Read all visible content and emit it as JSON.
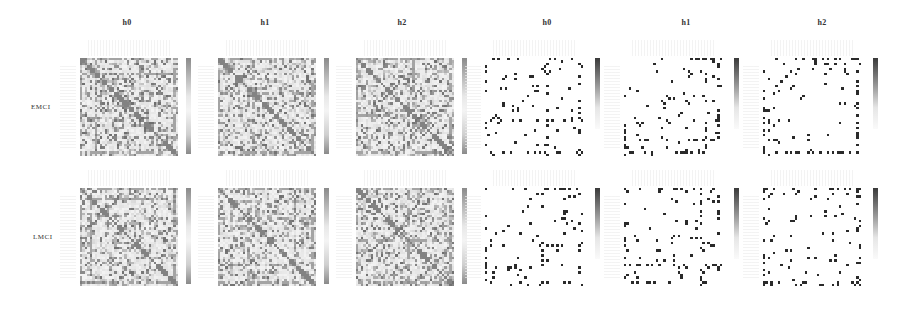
{
  "figure": {
    "column_headers": [
      "h0",
      "h1",
      "h2",
      "h0",
      "h1",
      "h2"
    ],
    "row_labels": [
      "EMCI",
      "LMCI"
    ]
  },
  "chart_data": {
    "type": "heatmap",
    "title": "",
    "layout": "2 rows x 6 columns of square connectivity matrices, each with a vertical grayscale colorbar",
    "rows": [
      "EMCI",
      "LMCI"
    ],
    "columns": [
      "h0",
      "h1",
      "h2",
      "h0",
      "h1",
      "h2"
    ],
    "groups": [
      {
        "name": "dense",
        "columns": [
          0,
          1,
          2
        ],
        "description": "dense grayscale matrices with visible diagonal and cross-band structure",
        "colormap": "gray (light)",
        "density": 0.45
      },
      {
        "name": "sparse",
        "columns": [
          3,
          4,
          5
        ],
        "description": "sparse binary-like matrices with isolated dark dots",
        "colormap": "gray (dark)",
        "density": 0.04
      }
    ],
    "matrix_size": 40,
    "grid": false,
    "legend": "colorbar right of each matrix (no tick labels visible)",
    "panels": [
      {
        "row": "EMCI",
        "col": "h0",
        "kind": "dense",
        "seed": 11
      },
      {
        "row": "EMCI",
        "col": "h1",
        "kind": "dense",
        "seed": 23
      },
      {
        "row": "EMCI",
        "col": "h2",
        "kind": "dense",
        "seed": 37
      },
      {
        "row": "EMCI",
        "col": "h0",
        "kind": "sparse",
        "seed": 41
      },
      {
        "row": "EMCI",
        "col": "h1",
        "kind": "sparse",
        "seed": 53
      },
      {
        "row": "EMCI",
        "col": "h2",
        "kind": "sparse",
        "seed": 67
      },
      {
        "row": "LMCI",
        "col": "h0",
        "kind": "dense",
        "seed": 71
      },
      {
        "row": "LMCI",
        "col": "h1",
        "kind": "dense",
        "seed": 83
      },
      {
        "row": "LMCI",
        "col": "h2",
        "kind": "dense",
        "seed": 97
      },
      {
        "row": "LMCI",
        "col": "h0",
        "kind": "sparse",
        "seed": 101
      },
      {
        "row": "LMCI",
        "col": "h1",
        "kind": "sparse",
        "seed": 113
      },
      {
        "row": "LMCI",
        "col": "h2",
        "kind": "sparse",
        "seed": 127
      }
    ]
  },
  "colors": {
    "dense_dark": "#6e6e6e",
    "dense_light": "#f4f4f4",
    "sparse_dot": "#2a2a2a",
    "cbar_dense_top": "#8a8a8a",
    "cbar_sparse_top": "#3a3a3a",
    "text": "#333333"
  }
}
